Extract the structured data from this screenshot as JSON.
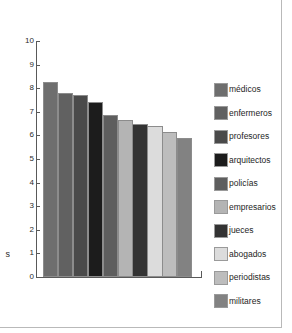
{
  "chart_data": {
    "type": "bar",
    "title": "",
    "subtitle": "",
    "xlabel": "",
    "ylabel": "s",
    "ylim": [
      0,
      10
    ],
    "grid": false,
    "legend_position": "right",
    "y_ticks": [
      "10",
      "9",
      "8",
      "7",
      "6",
      "5",
      "4",
      "3",
      "2",
      "1",
      "0"
    ],
    "categories": [
      "médicos",
      "enfermeros",
      "profesores",
      "arquitectos",
      "policías",
      "empresarios",
      "jueces",
      "abogados",
      "periodistas",
      "militares"
    ],
    "values": [
      8.25,
      7.8,
      7.7,
      7.4,
      6.85,
      6.65,
      6.5,
      6.4,
      6.15,
      5.9
    ],
    "colors": [
      "#6e6e6e",
      "#616161",
      "#4a4a4a",
      "#1c1c1c",
      "#5e5e5e",
      "#b4b4b4",
      "#333333",
      "#dcdcdc",
      "#bdbdbd",
      "#828282"
    ]
  },
  "legend": {
    "items": [
      {
        "label": "médicos",
        "color": "#6e6e6e"
      },
      {
        "label": "enfermeros",
        "color": "#616161"
      },
      {
        "label": "profesores",
        "color": "#4a4a4a"
      },
      {
        "label": "arquitectos",
        "color": "#1c1c1c"
      },
      {
        "label": "policías",
        "color": "#5e5e5e"
      },
      {
        "label": "empresarios",
        "color": "#b4b4b4"
      },
      {
        "label": "jueces",
        "color": "#333333"
      },
      {
        "label": "abogados",
        "color": "#dcdcdc"
      },
      {
        "label": "periodistas",
        "color": "#bdbdbd"
      },
      {
        "label": "militares",
        "color": "#828282"
      }
    ]
  },
  "axis": {
    "y_axis_clipped_label": "s"
  },
  "colors": {
    "axis": "#595959",
    "frame": "#b9b9b9",
    "background": "#ffffff",
    "text": "#1e1e1e"
  }
}
